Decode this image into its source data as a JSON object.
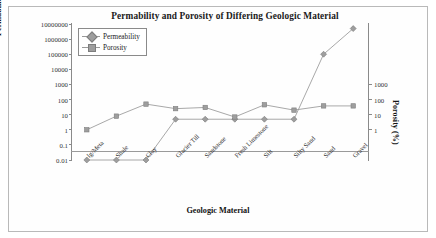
{
  "figure": {
    "title": "Permability and Porosity of Differing Geologic Material",
    "xlabel": "Geologic Material",
    "ylabel_left": "Permability (m/yr)",
    "ylabel_right": "Porosity (%)"
  },
  "legend": {
    "position": "top-left-inside",
    "entries": [
      {
        "label": "Permeability",
        "marker": "diamond-marker",
        "color": "#9e9e9e"
      },
      {
        "label": "Porosity",
        "marker": "square-marker",
        "color": "#9e9e9e"
      }
    ]
  },
  "axes": {
    "left_ticks": [
      "10000000",
      "1000000",
      "100000",
      "10000",
      "1000",
      "100",
      "10",
      "1",
      "0.1",
      "0.01"
    ],
    "right_ticks": [
      "1000",
      "100",
      "10",
      "1"
    ],
    "left_range": [
      0.01,
      10000000
    ],
    "right_range": [
      1,
      1000
    ],
    "scale": "log",
    "grid": false
  },
  "chart_data": {
    "type": "line",
    "title": "Permability and Porosity of Differing Geologic Material",
    "xlabel": "Geologic Material",
    "ylabel": "Permability (m/yr)",
    "ylabel_secondary": "Porosity (%)",
    "yscale": "log",
    "ylim": [
      0.01,
      10000000
    ],
    "ylim_secondary": [
      1,
      1000
    ],
    "grid": false,
    "legend_position": "upper left",
    "categories": [
      "Ig/Meta",
      "Shale",
      "Clay",
      "Glacier Till",
      "Sandstone",
      "Fresh Limestone",
      "Silt",
      "Silty Sand",
      "Sand",
      "Gravel"
    ],
    "series": [
      {
        "name": "Permeability",
        "axis": "left",
        "marker": "diamond",
        "color": "#9e9e9e",
        "values": [
          0.01,
          0.01,
          0.01,
          5,
          5,
          5,
          5,
          5,
          100000,
          5000000
        ]
      },
      {
        "name": "Porosity",
        "axis": "right",
        "marker": "square",
        "color": "#9e9e9e",
        "values": [
          1,
          8,
          50,
          25,
          30,
          7,
          45,
          20,
          38,
          38
        ]
      }
    ]
  }
}
